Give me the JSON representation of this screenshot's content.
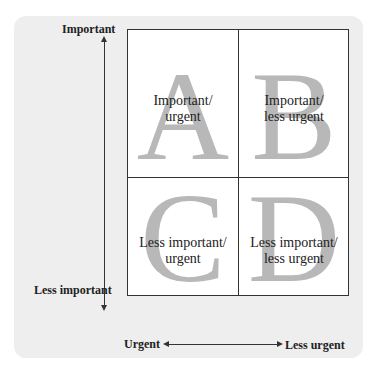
{
  "diagram": {
    "title": "",
    "y_axis": {
      "top_label": "Important",
      "bottom_label": "Less important"
    },
    "x_axis": {
      "left_label": "Urgent",
      "right_label": "Less urgent"
    },
    "quadrants": [
      {
        "letter": "A",
        "line1": "Important/",
        "line2": "urgent"
      },
      {
        "letter": "B",
        "line1": "Important/",
        "line2": "less urgent"
      },
      {
        "letter": "C",
        "line1": "Less important/",
        "line2": "urgent"
      },
      {
        "letter": "D",
        "line1": "Less important/",
        "line2": "less urgent"
      }
    ],
    "colors": {
      "panel": "#eeeeee",
      "letter": "#b8b8b8",
      "line": "#333333",
      "text": "#222222"
    }
  }
}
